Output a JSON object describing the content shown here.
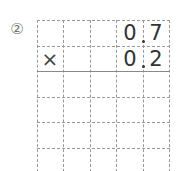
{
  "problem": {
    "number_label": "②",
    "multiplicand": {
      "ones": "0",
      "tenths": "7",
      "text": "0.7"
    },
    "operator": "×",
    "multiplier": {
      "ones": "0",
      "tenths": "2",
      "text": "0.2"
    }
  },
  "grid": {
    "columns": 5,
    "rows": 6
  }
}
